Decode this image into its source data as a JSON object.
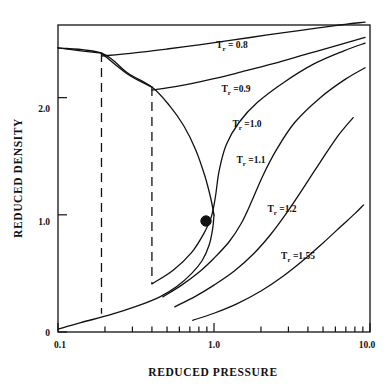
{
  "chart_data": {
    "type": "line",
    "title": "",
    "xlabel": "REDUCED PRESSURE",
    "ylabel": "REDUCED DENSITY",
    "xscale": "log",
    "yscale": "linear",
    "xlim": [
      0.1,
      10.0
    ],
    "ylim": [
      0,
      2.62
    ],
    "grid": false,
    "legend_position": "inline-labels",
    "x_tick_labels": [
      "0.1",
      "1.0",
      "10.0"
    ],
    "x_tick_values": [
      0.1,
      1.0,
      10.0
    ],
    "x_minor_ticks": [
      0.2,
      0.3,
      0.4,
      0.5,
      0.6,
      0.7,
      0.8,
      0.9,
      2.0,
      3.0,
      4.0,
      5.0,
      6.0,
      7.0,
      8.0,
      9.0
    ],
    "y_tick_labels": [
      "0",
      "1.0",
      "2.0"
    ],
    "y_tick_values": [
      0,
      1.0,
      2.0
    ],
    "critical_point": {
      "x": 1.0,
      "y": 1.0,
      "label": ""
    },
    "series": [
      {
        "name": "Tr = 0.8",
        "label": "T<sub>r</sub> = 0.8",
        "liquid_branch": [
          [
            0.1,
            2.425
          ],
          [
            0.14,
            2.4
          ],
          [
            0.19,
            2.38
          ]
        ],
        "vapor_saturation_x": 0.19,
        "points": [
          [
            0.19,
            2.355
          ],
          [
            0.3,
            2.38
          ],
          [
            0.5,
            2.415
          ],
          [
            0.8,
            2.45
          ],
          [
            1.3,
            2.49
          ],
          [
            2.2,
            2.535
          ],
          [
            3.6,
            2.575
          ],
          [
            6.0,
            2.615
          ],
          [
            9.3,
            2.645
          ]
        ],
        "vapor_points": [
          [
            0.1,
            0.025
          ],
          [
            0.12,
            0.06
          ],
          [
            0.15,
            0.105
          ],
          [
            0.19,
            0.155
          ]
        ]
      },
      {
        "name": "Tr = 0.9",
        "label": "T<sub>r</sub> =0.9",
        "liquid_branch": [
          [
            0.19,
            2.38
          ],
          [
            0.28,
            2.2
          ],
          [
            0.4,
            2.09
          ]
        ],
        "vapor_saturation_x": 0.4,
        "points": [
          [
            0.4,
            2.065
          ],
          [
            0.6,
            2.1
          ],
          [
            0.95,
            2.155
          ],
          [
            1.5,
            2.22
          ],
          [
            2.4,
            2.29
          ],
          [
            4.0,
            2.375
          ],
          [
            6.5,
            2.455
          ],
          [
            9.3,
            2.515
          ]
        ],
        "vapor_points": [
          [
            0.19,
            0.155
          ],
          [
            0.25,
            0.23
          ],
          [
            0.32,
            0.32
          ],
          [
            0.4,
            0.41
          ]
        ]
      },
      {
        "name": "Tr = 1.0",
        "label": "T<sub>r</sub> =1.0",
        "points": [
          [
            0.4,
            0.41
          ],
          [
            0.55,
            0.53
          ],
          [
            0.72,
            0.68
          ],
          [
            0.86,
            0.84
          ],
          [
            0.96,
            0.98
          ],
          [
            1.02,
            1.15
          ],
          [
            1.08,
            1.38
          ],
          [
            1.2,
            1.6
          ],
          [
            1.45,
            1.79
          ],
          [
            1.9,
            1.96
          ],
          [
            2.8,
            2.13
          ],
          [
            4.4,
            2.29
          ],
          [
            6.8,
            2.4
          ],
          [
            9.3,
            2.465
          ]
        ]
      },
      {
        "name": "Tr = 1.1",
        "label": "T<sub>r</sub> =1.1",
        "points": [
          [
            0.47,
            0.3
          ],
          [
            0.62,
            0.4
          ],
          [
            0.8,
            0.51
          ],
          [
            1.0,
            0.63
          ],
          [
            1.25,
            0.77
          ],
          [
            1.5,
            0.93
          ],
          [
            1.75,
            1.12
          ],
          [
            2.05,
            1.33
          ],
          [
            2.5,
            1.55
          ],
          [
            3.3,
            1.79
          ],
          [
            4.8,
            2.0
          ],
          [
            7.0,
            2.16
          ],
          [
            9.3,
            2.255
          ]
        ]
      },
      {
        "name": "Tr = 1.2",
        "label": "T<sub>r</sub> =1.2",
        "points": [
          [
            0.56,
            0.215
          ],
          [
            0.75,
            0.3
          ],
          [
            1.0,
            0.4
          ],
          [
            1.35,
            0.52
          ],
          [
            1.8,
            0.67
          ],
          [
            2.3,
            0.83
          ],
          [
            2.9,
            1.01
          ],
          [
            3.7,
            1.22
          ],
          [
            4.8,
            1.45
          ],
          [
            6.2,
            1.67
          ],
          [
            7.8,
            1.83
          ]
        ]
      },
      {
        "name": "Tr = 1.55",
        "label": "T<sub>r</sub> =1.55",
        "points": [
          [
            0.73,
            0.1
          ],
          [
            1.0,
            0.16
          ],
          [
            1.4,
            0.24
          ],
          [
            2.0,
            0.35
          ],
          [
            2.8,
            0.48
          ],
          [
            3.8,
            0.62
          ],
          [
            5.0,
            0.76
          ],
          [
            6.5,
            0.9
          ],
          [
            8.0,
            1.01
          ],
          [
            9.1,
            1.085
          ]
        ]
      }
    ],
    "two_phase_dome": {
      "description": "saturation dome connecting liquid and vapor branches through the critical point",
      "liquid_side": [
        [
          0.1,
          2.425
        ],
        [
          0.19,
          2.38
        ],
        [
          0.28,
          2.21
        ],
        [
          0.4,
          2.09
        ],
        [
          0.52,
          1.93
        ],
        [
          0.64,
          1.76
        ],
        [
          0.76,
          1.56
        ],
        [
          0.87,
          1.34
        ],
        [
          0.95,
          1.15
        ],
        [
          1.0,
          1.0
        ]
      ],
      "vapor_side": [
        [
          1.0,
          1.0
        ],
        [
          0.98,
          0.88
        ],
        [
          0.93,
          0.74
        ],
        [
          0.84,
          0.61
        ],
        [
          0.72,
          0.5
        ],
        [
          0.58,
          0.39
        ],
        [
          0.45,
          0.3
        ],
        [
          0.32,
          0.22
        ],
        [
          0.22,
          0.15
        ],
        [
          0.14,
          0.08
        ],
        [
          0.1,
          0.025
        ]
      ]
    },
    "tie_lines": [
      {
        "x": 0.19,
        "y_top": 2.38,
        "y_bottom": 0.155,
        "style": "dashed"
      },
      {
        "x": 0.4,
        "y_top": 2.09,
        "y_bottom": 0.41,
        "style": "dashed"
      }
    ]
  },
  "axes": {
    "x_title": "REDUCED PRESSURE",
    "y_title": "REDUCED DENSITY",
    "x_labels": [
      "0.1",
      "1.0",
      "10.0"
    ],
    "y_labels": [
      "0",
      "1.0",
      "2.0"
    ]
  },
  "curve_labels": [
    {
      "id": "label-tr-0-8",
      "text_main": "T",
      "text_sub": "r",
      "text_rest": " = 0.8"
    },
    {
      "id": "label-tr-0-9",
      "text_main": "T",
      "text_sub": "r",
      "text_rest": " =0.9"
    },
    {
      "id": "label-tr-1-0",
      "text_main": "T",
      "text_sub": "r",
      "text_rest": " =1.0"
    },
    {
      "id": "label-tr-1-1",
      "text_main": "T",
      "text_sub": "r",
      "text_rest": " =1.1"
    },
    {
      "id": "label-tr-1-2",
      "text_main": "T",
      "text_sub": "r",
      "text_rest": " =1.2"
    },
    {
      "id": "label-tr-1-55",
      "text_main": "T",
      "text_sub": "r",
      "text_rest": " =1.55"
    }
  ],
  "colors": {
    "ink": "#111111",
    "background": "#ffffff"
  }
}
